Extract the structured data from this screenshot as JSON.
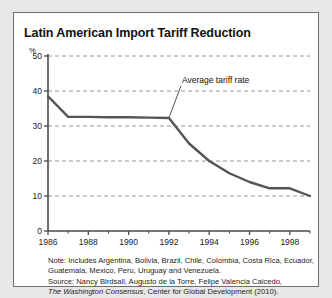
{
  "figure": {
    "title": "Latin American Import Tariff Reduction",
    "accent_color": "#000000",
    "line_color": "#555555",
    "grid_color": "#8a8a8a",
    "axis_color": "#6e6e6e",
    "panel_background": "#ffffff",
    "page_background": "#e8e8e6"
  },
  "notes": {
    "line1": "Note: Includes Argentina, Bolivia, Brazil, Chile, Colombia, Costa Rica, Ecuador,",
    "line2": "Guatemala, Mexico, Peru, Uruguay and Venezuela.",
    "line3_prefix": "Source: Nancy Birdsall, Augusto de la Torre, Felipe Valencia Caicedo,",
    "line4_italic": "The Washington Consensus",
    "line4_rest": ", Center for Global Development (2010)."
  },
  "chart_data": {
    "type": "line",
    "title": "Latin American Import Tariff Reduction",
    "xlabel": "",
    "ylabel": "%",
    "ylim": [
      0,
      50
    ],
    "xlim": [
      1986,
      1999
    ],
    "yticks": [
      0,
      10,
      20,
      30,
      40,
      50
    ],
    "ytick_labels": [
      "0",
      "10",
      "20",
      "30",
      "40",
      "50"
    ],
    "xticks": [
      1986,
      1988,
      1990,
      1992,
      1994,
      1996,
      1998
    ],
    "xtick_labels": [
      "1986",
      "1988",
      "1990",
      "1992",
      "1994",
      "1996",
      "1998"
    ],
    "x_minor_ticks": [
      1987,
      1989,
      1991,
      1993,
      1995,
      1997,
      1999
    ],
    "grid": "horizontal-dashed",
    "legend": "none",
    "annotations": [
      {
        "text": "Average tariff rate",
        "x": 1992.0,
        "y": 32.3,
        "label_x": 1992.6,
        "label_y": 41.5
      }
    ],
    "series": [
      {
        "name": "Average tariff rate",
        "x": [
          1986,
          1987,
          1988,
          1989,
          1990,
          1991,
          1992,
          1993,
          1994,
          1995,
          1996,
          1997,
          1998,
          1999
        ],
        "values": [
          38.5,
          32.6,
          32.6,
          32.5,
          32.5,
          32.4,
          32.3,
          25.0,
          20.0,
          16.5,
          14.0,
          12.2,
          12.2,
          10.0
        ]
      }
    ]
  }
}
